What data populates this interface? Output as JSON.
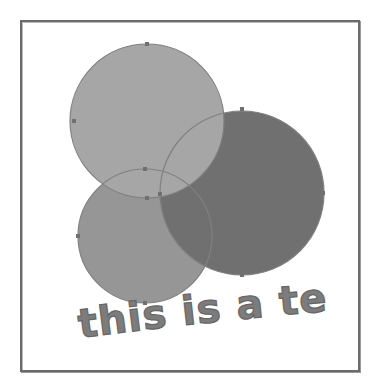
{
  "canvas": {
    "caption_text": "this is a test",
    "colors": {
      "background": "#ffffff",
      "frame_border": "#6a6a6a",
      "circle_top": "#a6a6a6",
      "circle_bottom_left": "#969696",
      "circle_big": "#707070",
      "outline": "#808080",
      "text": "#7c7c7c"
    },
    "shapes": [
      {
        "name": "circle-top",
        "cx": 147,
        "cy": 121,
        "r": 77
      },
      {
        "name": "circle-bottom-left",
        "cx": 145,
        "cy": 236,
        "r": 67
      },
      {
        "name": "circle-big",
        "cx": 242,
        "cy": 193,
        "r": 82
      }
    ]
  }
}
